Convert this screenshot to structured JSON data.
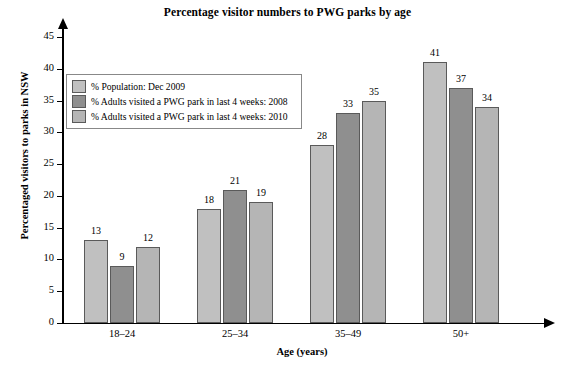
{
  "chart_data": {
    "type": "bar",
    "title": "Percentage visitor numbers to PWG parks by age",
    "xlabel": "Age (years)",
    "ylabel": "Percentaged visitors to parks in NSW",
    "categories": [
      "18–24",
      "25–34",
      "35–49",
      "50+"
    ],
    "series": [
      {
        "name": "% Population: Dec 2009",
        "values": [
          13,
          18,
          28,
          41
        ],
        "color": "#c0c0c0"
      },
      {
        "name": "% Adults visited a PWG park in last 4 weeks: 2008",
        "values": [
          9,
          21,
          33,
          37
        ],
        "color": "#8f8f8f"
      },
      {
        "name": "% Adults visited a PWG park in last 4 weeks: 2010",
        "values": [
          12,
          19,
          35,
          34
        ],
        "color": "#b5b5b5"
      }
    ],
    "ylim": [
      0,
      45
    ],
    "yticks": [
      0,
      5,
      10,
      15,
      20,
      25,
      30,
      35,
      40,
      45
    ],
    "grid": false,
    "legend_position": "upper-left-inside"
  },
  "axis": {
    "y_tick_labels": [
      "0",
      "5",
      "10",
      "15",
      "20",
      "25",
      "30",
      "35",
      "40",
      "45"
    ]
  }
}
